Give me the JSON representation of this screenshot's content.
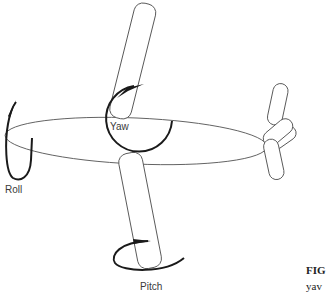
{
  "diagram": {
    "type": "aircraft-axes-of-rotation",
    "labels": {
      "yaw": "Yaw",
      "roll": "Roll",
      "pitch": "Pitch"
    },
    "caption": {
      "prefix": "FIG",
      "line2": "yav"
    },
    "colors": {
      "outline": "#555555",
      "arrow": "#1a1a1a",
      "label": "#3a3a3a",
      "background": "#ffffff"
    }
  }
}
